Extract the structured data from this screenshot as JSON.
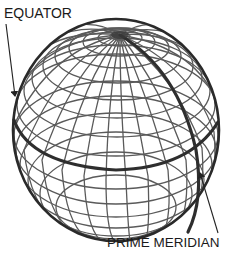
{
  "diagram": {
    "labels": {
      "equator": "EQUATOR",
      "prime_meridian": "PRIME MERIDIAN"
    },
    "colors": {
      "background": "#ffffff",
      "grid": "#555555",
      "outline": "#2a2a2a",
      "highlight_lines": "#333333",
      "text": "#1a1a1a"
    }
  }
}
